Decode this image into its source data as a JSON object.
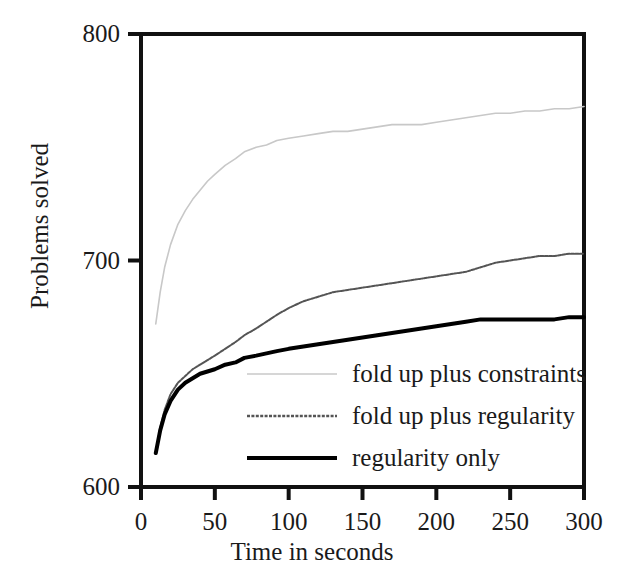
{
  "chart_data": {
    "type": "line",
    "title": "",
    "xlabel": "Time in seconds",
    "ylabel": "Problems solved",
    "xlim": [
      0,
      300
    ],
    "ylim": [
      600,
      800
    ],
    "xticks": [
      0,
      50,
      100,
      150,
      200,
      250,
      300
    ],
    "yticks": [
      600,
      700,
      800
    ],
    "xtick_labels": [
      "0",
      "50",
      "100",
      "150",
      "200",
      "250",
      "300"
    ],
    "ytick_labels": [
      "600",
      "700",
      "800"
    ],
    "grid": false,
    "legend_position": "inside lower right",
    "series": [
      {
        "name": "fold up plus constraints",
        "color": "#c8c8c8",
        "style": "thin-light",
        "width": 1.6,
        "x": [
          10,
          13,
          16,
          20,
          25,
          30,
          35,
          40,
          45,
          50,
          57,
          64,
          70,
          78,
          85,
          92,
          100,
          110,
          120,
          130,
          140,
          150,
          160,
          170,
          180,
          190,
          200,
          210,
          220,
          230,
          240,
          250,
          260,
          270,
          280,
          290,
          300
        ],
        "y": [
          672,
          686,
          697,
          707,
          716,
          722,
          727,
          731,
          735,
          738,
          742,
          745,
          748,
          750,
          751,
          753,
          754,
          755,
          756,
          757,
          757,
          758,
          759,
          760,
          760,
          760,
          761,
          762,
          763,
          764,
          765,
          765,
          766,
          766,
          767,
          767,
          768
        ]
      },
      {
        "name": "fold up plus regularity",
        "color": "#555555",
        "style": "dotted-medium",
        "width": 2.0,
        "x": [
          10,
          13,
          16,
          20,
          25,
          30,
          35,
          40,
          45,
          50,
          57,
          64,
          70,
          78,
          85,
          92,
          100,
          110,
          120,
          130,
          140,
          150,
          160,
          170,
          180,
          190,
          200,
          210,
          220,
          230,
          240,
          250,
          260,
          270,
          280,
          290,
          300
        ],
        "y": [
          615,
          626,
          634,
          641,
          646,
          649,
          652,
          654,
          656,
          658,
          661,
          664,
          667,
          670,
          673,
          676,
          679,
          682,
          684,
          686,
          687,
          688,
          689,
          690,
          691,
          692,
          693,
          694,
          695,
          697,
          699,
          700,
          701,
          702,
          702,
          703,
          703
        ]
      },
      {
        "name": "regularity only",
        "color": "#000000",
        "style": "solid-thick",
        "width": 4.0,
        "x": [
          10,
          13,
          16,
          20,
          25,
          30,
          35,
          40,
          45,
          50,
          57,
          64,
          70,
          78,
          85,
          92,
          100,
          110,
          120,
          130,
          140,
          150,
          160,
          170,
          180,
          190,
          200,
          210,
          220,
          230,
          240,
          250,
          260,
          270,
          280,
          290,
          300
        ],
        "y": [
          615,
          625,
          632,
          638,
          643,
          646,
          648,
          650,
          651,
          652,
          654,
          655,
          657,
          658,
          659,
          660,
          661,
          662,
          663,
          664,
          665,
          666,
          667,
          668,
          669,
          670,
          671,
          672,
          673,
          674,
          674,
          674,
          674,
          674,
          674,
          675,
          675
        ]
      }
    ],
    "legend": [
      {
        "label": "fold up plus constraints",
        "color": "#c8c8c8",
        "style": "thin-light"
      },
      {
        "label": "fold up plus regularity",
        "color": "#555555",
        "style": "dotted-medium"
      },
      {
        "label": "regularity only",
        "color": "#000000",
        "style": "solid-thick"
      }
    ]
  },
  "axis": {
    "x_title": "Time in seconds",
    "y_title": "Problems solved"
  }
}
